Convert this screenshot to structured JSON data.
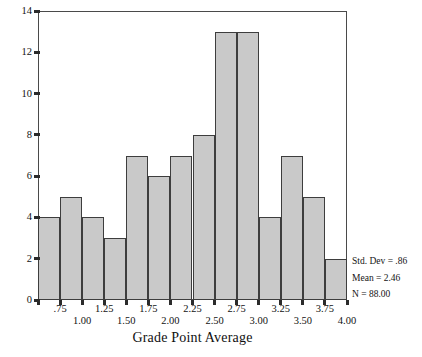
{
  "chart_data": {
    "type": "bar",
    "title": "",
    "subtitle": "",
    "xlabel": "Grade Point Average",
    "ylabel": "",
    "grid": false,
    "legend_position": "right-bottom",
    "xlim": [
      0.5,
      4.0
    ],
    "ylim": [
      0,
      14
    ],
    "bin_width": 0.25,
    "bin_edges": [
      0.5,
      0.75,
      1.0,
      1.25,
      1.5,
      1.75,
      2.0,
      2.25,
      2.5,
      2.75,
      3.0,
      3.25,
      3.5,
      3.75,
      4.0
    ],
    "bin_centers": [
      0.625,
      0.875,
      1.125,
      1.375,
      1.625,
      1.875,
      2.125,
      2.375,
      2.625,
      2.875,
      3.125,
      3.375,
      3.625,
      3.875
    ],
    "categories": [
      "0.50-0.75",
      "0.75-1.00",
      "1.00-1.25",
      "1.25-1.50",
      "1.50-1.75",
      "1.75-2.00",
      "2.00-2.25",
      "2.25-2.50",
      "2.50-2.75",
      "2.75-3.00",
      "3.00-3.25",
      "3.25-3.50",
      "3.50-3.75",
      "3.75-4.00"
    ],
    "values": [
      4,
      5,
      4,
      3,
      7,
      6,
      7,
      8,
      13,
      13,
      4,
      7,
      5,
      2
    ],
    "y_ticks": [
      0,
      2,
      4,
      6,
      8,
      10,
      12,
      14
    ],
    "y_tick_labels": [
      "0",
      "2",
      "4",
      "6",
      "8",
      "10",
      "12",
      "14"
    ],
    "x_ticks_upper": [
      0.75,
      1.25,
      1.75,
      2.25,
      2.75,
      3.25,
      3.75
    ],
    "x_tick_labels_upper": [
      ".75",
      "1.25",
      "1.75",
      "2.25",
      "2.75",
      "3.25",
      "3.75"
    ],
    "x_ticks_lower": [
      1.0,
      1.5,
      2.0,
      2.5,
      3.0,
      3.5,
      4.0
    ],
    "x_tick_labels_lower": [
      "1.00",
      "1.50",
      "2.00",
      "2.50",
      "3.00",
      "3.50",
      "4.00"
    ],
    "annotations": [
      "Std. Dev = .86",
      "Mean = 2.46",
      "N = 88.00"
    ],
    "colors": {
      "bar_fill": "#c9c9c9",
      "bar_border": "#3d3d3d",
      "axis": "#4a4a4a",
      "text": "#121212",
      "background": "#ffffff"
    }
  },
  "stats": {
    "std_dev": "Std. Dev = .86",
    "mean": "Mean = 2.46",
    "n": "N = 88.00"
  },
  "axis": {
    "x_title": "Grade Point Average"
  }
}
